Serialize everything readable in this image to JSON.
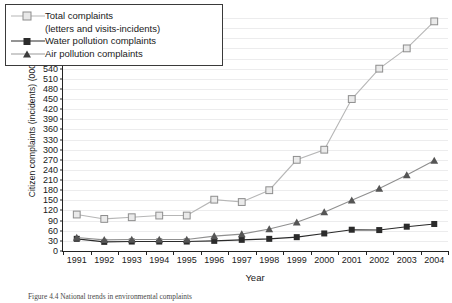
{
  "figure": {
    "caption": "Figure 4.4 National trends in environmental complaints"
  },
  "chart_data": {
    "type": "line",
    "title": "",
    "xlabel": "Year",
    "ylabel": "Citizen complaints (incidents) (000s)",
    "ylim": [
      0,
      690
    ],
    "ytick_step": 30,
    "grid": true,
    "legend_position": "top-left",
    "categories": [
      "1991",
      "1992",
      "1993",
      "1994",
      "1995",
      "1996",
      "1997",
      "1998",
      "1999",
      "2000",
      "2001",
      "2002",
      "2003",
      "2004"
    ],
    "series": [
      {
        "name": "Total complaints (letters and visits-incidents)",
        "label_line1": "Total complaints",
        "label_line2": "(letters and visits-incidents)",
        "marker": "open-square",
        "color": "#b6b6b6",
        "values": [
          108,
          95,
          100,
          105,
          105,
          152,
          145,
          180,
          270,
          300,
          450,
          540,
          600,
          680
        ]
      },
      {
        "name": "Water pollution complaints",
        "label_line1": "Water pollution complaints",
        "marker": "filled-square",
        "color": "#2b2b2b",
        "values": [
          36,
          27,
          28,
          28,
          28,
          30,
          33,
          36,
          41,
          52,
          63,
          62,
          72,
          80
        ]
      },
      {
        "name": "Air pollution complaints",
        "label_line1": "Air pollution complaints",
        "marker": "filled-triangle",
        "color": "#555555",
        "values": [
          40,
          33,
          34,
          34,
          34,
          44,
          50,
          65,
          85,
          115,
          150,
          185,
          225,
          268
        ]
      }
    ]
  }
}
